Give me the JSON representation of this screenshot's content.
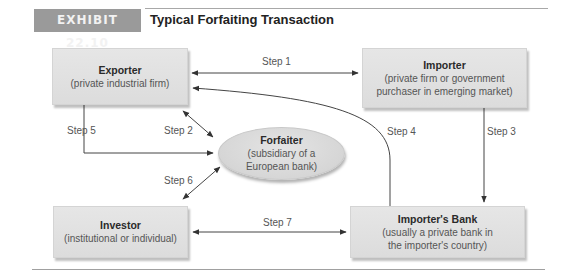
{
  "header": {
    "exhibit_label": "EXHIBIT 22.10",
    "title": "Typical Forfaiting Transaction"
  },
  "nodes": {
    "exporter": {
      "title": "Exporter",
      "subtitle": "(private industrial firm)"
    },
    "importer": {
      "title": "Importer",
      "subtitle_line1": "(private firm or government",
      "subtitle_line2": "purchaser in emerging market)"
    },
    "forfaiter": {
      "title": "Forfaiter",
      "subtitle_line1": "(subsidiary of a",
      "subtitle_line2": "European bank)"
    },
    "investor": {
      "title": "Investor",
      "subtitle": "(institutional or individual)"
    },
    "importers_bank": {
      "title": "Importer's Bank",
      "subtitle_line1": "(usually a private bank in",
      "subtitle_line2": "the importer's country)"
    }
  },
  "steps": {
    "step1": "Step 1",
    "step2": "Step 2",
    "step3": "Step 3",
    "step4": "Step 4",
    "step5": "Step 5",
    "step6": "Step 6",
    "step7": "Step 7"
  },
  "edges": [
    {
      "step": "Step 1",
      "from": "Exporter",
      "to": "Importer",
      "direction": "both"
    },
    {
      "step": "Step 2",
      "from": "Exporter",
      "to": "Forfaiter",
      "direction": "both"
    },
    {
      "step": "Step 3",
      "from": "Importer",
      "to": "Importer's Bank",
      "direction": "forward"
    },
    {
      "step": "Step 4",
      "from": "Importer's Bank",
      "to": "Exporter",
      "direction": "forward"
    },
    {
      "step": "Step 5",
      "from": "Exporter",
      "to": "Forfaiter",
      "direction": "forward"
    },
    {
      "step": "Step 6",
      "from": "Forfaiter",
      "to": "Investor",
      "direction": "both"
    },
    {
      "step": "Step 7",
      "from": "Investor",
      "to": "Importer's Bank",
      "direction": "both"
    }
  ],
  "colors": {
    "exhibit_tag_bg": "#9a9a9a",
    "node_fill": "#e2e2e2",
    "arrow": "#333333"
  }
}
